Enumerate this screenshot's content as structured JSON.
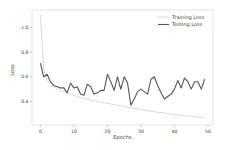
{
  "chart_data": {
    "type": "line",
    "title": "",
    "xlabel": "Epochs",
    "ylabel": "Loss",
    "xlim": [
      -2.5,
      51.5
    ],
    "ylim": [
      0.21,
      1.14
    ],
    "xticks": [
      0,
      10,
      20,
      30,
      40,
      50
    ],
    "xtick_labels": [
      "0",
      "10",
      "20",
      "30",
      "40",
      "50"
    ],
    "yticks": [
      0.4,
      0.6,
      0.8,
      1.0
    ],
    "ytick_labels": [
      "0.4",
      "0.6",
      "0.8",
      "1.0"
    ],
    "grid": false,
    "legend_position": "top-right",
    "x": [
      0,
      1,
      2,
      3,
      4,
      5,
      6,
      7,
      8,
      9,
      10,
      11,
      12,
      13,
      14,
      15,
      16,
      17,
      18,
      19,
      20,
      21,
      22,
      23,
      24,
      25,
      26,
      27,
      28,
      29,
      30,
      31,
      32,
      33,
      34,
      35,
      36,
      37,
      38,
      39,
      40,
      41,
      42,
      43,
      44,
      45,
      46,
      47,
      48,
      49
    ],
    "series": [
      {
        "name": "Training Loss",
        "color": "#bdbdbd",
        "values": [
          1.1,
          0.66,
          0.57,
          0.54,
          0.52,
          0.5,
          0.49,
          0.48,
          0.47,
          0.46,
          0.45,
          0.44,
          0.43,
          0.425,
          0.42,
          0.41,
          0.405,
          0.4,
          0.395,
          0.39,
          0.385,
          0.38,
          0.375,
          0.37,
          0.365,
          0.36,
          0.355,
          0.35,
          0.345,
          0.34,
          0.335,
          0.33,
          0.325,
          0.32,
          0.317,
          0.313,
          0.31,
          0.306,
          0.302,
          0.298,
          0.295,
          0.292,
          0.289,
          0.286,
          0.283,
          0.28,
          0.277,
          0.274,
          0.271,
          0.268
        ]
      },
      {
        "name": "Testing Loss",
        "color": "#555555",
        "values": [
          0.71,
          0.6,
          0.62,
          0.56,
          0.53,
          0.52,
          0.51,
          0.51,
          0.47,
          0.55,
          0.51,
          0.52,
          0.46,
          0.45,
          0.54,
          0.52,
          0.46,
          0.47,
          0.49,
          0.49,
          0.62,
          0.56,
          0.49,
          0.6,
          0.5,
          0.6,
          0.55,
          0.37,
          0.42,
          0.48,
          0.5,
          0.48,
          0.46,
          0.58,
          0.6,
          0.53,
          0.47,
          0.42,
          0.44,
          0.46,
          0.5,
          0.57,
          0.51,
          0.59,
          0.56,
          0.5,
          0.56,
          0.56,
          0.5,
          0.58
        ]
      }
    ]
  }
}
